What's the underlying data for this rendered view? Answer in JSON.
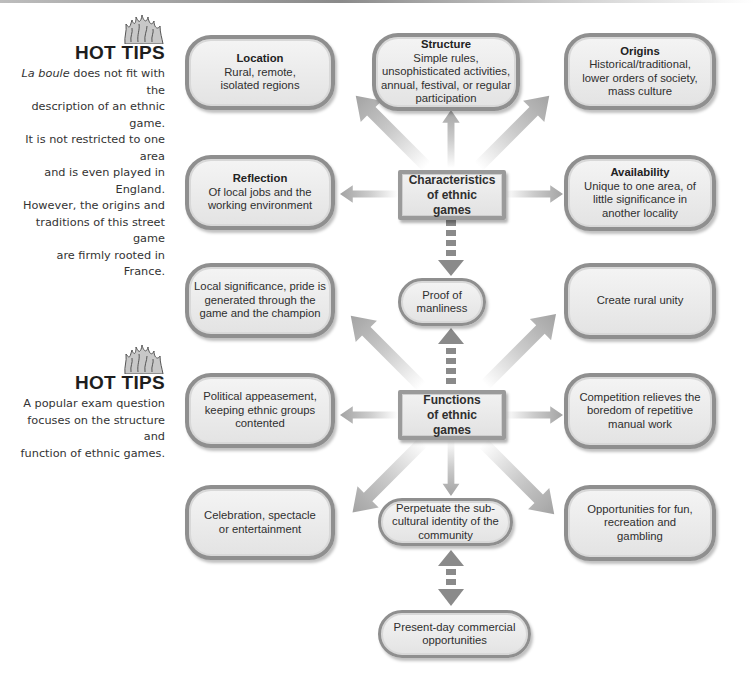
{
  "hot_tips": [
    {
      "title": "HOT TIPS",
      "body_italic": "La boule",
      "body_rest_line1": " does not fit with the",
      "body_lines": [
        "description of an ethnic game.",
        "It is not restricted to one area",
        "and is even played in England.",
        "However, the origins and",
        "traditions of this street game",
        "are firmly rooted in France."
      ]
    },
    {
      "title": "HOT TIPS",
      "body_lines": [
        "A popular exam question",
        "focuses on the structure and",
        "function of ethnic games."
      ]
    }
  ],
  "characteristics": {
    "center": {
      "line1": "Characteristics",
      "line2": "of ethnic games"
    },
    "items": [
      {
        "title": "Location",
        "text": "Rural, remote, isolated regions"
      },
      {
        "title": "Structure",
        "text": "Simple rules, unsophisticated activities, annual, festival, or regular participation"
      },
      {
        "title": "Origins",
        "text": "Historical/traditional, lower orders of society, mass culture"
      },
      {
        "title": "Reflection",
        "text": "Of local jobs and the working environment"
      },
      {
        "title": "Availability",
        "text": "Unique to one area, of little significance in another locality"
      }
    ]
  },
  "link_node": {
    "text": "Proof of manliness"
  },
  "functions": {
    "center": {
      "line1": "Functions",
      "line2": "of ethnic games"
    },
    "items": [
      {
        "text": "Local significance, pride is generated through the game and the champion"
      },
      {
        "text": "Create rural unity"
      },
      {
        "text": "Political appeasement, keeping ethnic groups contented"
      },
      {
        "text": "Competition relieves the boredom of repetitive manual work"
      },
      {
        "text": "Celebration, spectacle or entertainment"
      },
      {
        "text": "Perpetuate the sub-cultural identity of the community"
      },
      {
        "text": "Opportunities for fun, recreation and gambling"
      }
    ]
  },
  "bottom_node": {
    "text": "Present-day commercial opportunities"
  },
  "colors": {
    "box_border": "#8f8f8f",
    "box_fill": "#ececec",
    "arrow": "#a8a8a8",
    "dashed_arrow": "#8a8a8a",
    "text": "#2b2b2b"
  }
}
